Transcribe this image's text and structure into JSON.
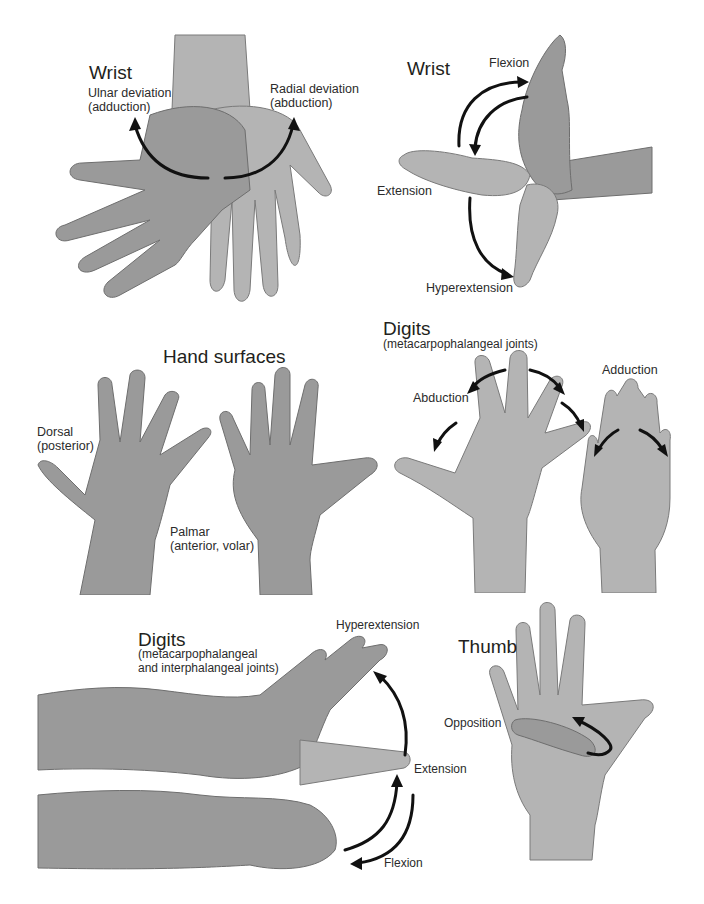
{
  "figure": {
    "panels": [
      {
        "id": "wrist-deviation",
        "title": "Wrist",
        "labels": {
          "ulnar_line1": "Ulnar deviation",
          "ulnar_line2": "(adduction)",
          "radial_line1": "Radial deviation",
          "radial_line2": "(abduction)"
        }
      },
      {
        "id": "wrist-flexion",
        "title": "Wrist",
        "labels": {
          "flexion": "Flexion",
          "extension": "Extension",
          "hyperextension": "Hyperextension"
        }
      },
      {
        "id": "hand-surfaces",
        "title": "Hand surfaces",
        "labels": {
          "dorsal_line1": "Dorsal",
          "dorsal_line2": "(posterior)",
          "palmar_line1": "Palmar",
          "palmar_line2": "(anterior, volar)"
        }
      },
      {
        "id": "digits-mcp",
        "title": "Digits",
        "subtitle": "(metacarpophalangeal joints)",
        "labels": {
          "abduction": "Abduction",
          "adduction": "Adduction"
        }
      },
      {
        "id": "digits-mcp-ip",
        "title": "Digits",
        "subtitle_line1": "(metacarpophalangeal",
        "subtitle_line2": "and interphalangeal joints)",
        "labels": {
          "hyperextension": "Hyperextension",
          "extension": "Extension",
          "flexion": "Flexion"
        }
      },
      {
        "id": "thumb",
        "title": "Thumb",
        "labels": {
          "opposition": "Opposition"
        }
      }
    ],
    "colors": {
      "background": "#ffffff",
      "text": "#231f20",
      "arrow": "#111111",
      "skin_tone": "#9a9a9a"
    }
  }
}
